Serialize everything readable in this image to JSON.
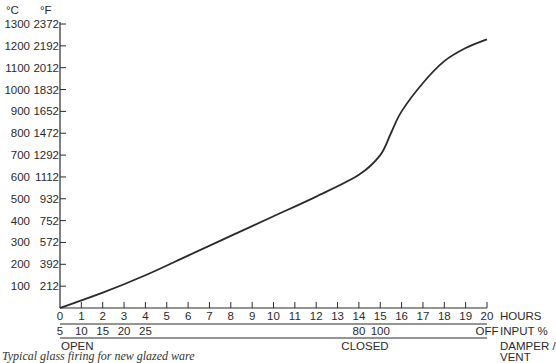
{
  "chart_data": {
    "type": "line",
    "title": "",
    "caption": "Typical glass firing for new glazed ware",
    "xlabel": "HOURS",
    "ylabel_celsius": "°C",
    "ylabel_fahrenheit": "°F",
    "y_ticks_celsius": [
      "100",
      "200",
      "300",
      "400",
      "500",
      "600",
      "700",
      "800",
      "900",
      "1000",
      "1100",
      "1200",
      "1300"
    ],
    "y_ticks_fahrenheit": [
      "212",
      "392",
      "572",
      "752",
      "932",
      "1112",
      "1292",
      "1472",
      "1652",
      "1832",
      "2012",
      "2192",
      "2372"
    ],
    "ylim": [
      0,
      1300
    ],
    "x_ticks": [
      "0",
      "1",
      "2",
      "3",
      "4",
      "5",
      "6",
      "7",
      "8",
      "9",
      "10",
      "11",
      "12",
      "13",
      "14",
      "15",
      "16",
      "17",
      "18",
      "19",
      "20"
    ],
    "xlim": [
      0,
      20
    ],
    "grid": false,
    "series": [
      {
        "name": "Firing temperature (°C)",
        "x": [
          0,
          1,
          2,
          3,
          4,
          5,
          6,
          7,
          8,
          9,
          10,
          11,
          12,
          13,
          14,
          15,
          15.5,
          16,
          17,
          18,
          19,
          20
        ],
        "values": [
          0,
          60,
          130,
          200,
          270,
          350,
          430,
          510,
          590,
          670,
          750,
          830,
          910,
          990,
          1080,
          1200,
          1380,
          1560,
          1800,
          1970,
          2060,
          2100
        ]
      }
    ],
    "values_celsius_est": {
      "x": [
        0,
        2,
        4,
        6,
        8,
        10,
        12,
        14,
        15,
        15.5,
        16,
        17,
        18,
        19,
        20
      ],
      "y": [
        0,
        70,
        150,
        240,
        330,
        420,
        510,
        610,
        700,
        800,
        900,
        1030,
        1130,
        1190,
        1230
      ]
    },
    "annotations": {
      "input_row_label": "INPUT %",
      "input_values": [
        {
          "hour": 0,
          "label": "5"
        },
        {
          "hour": 1,
          "label": "10"
        },
        {
          "hour": 2,
          "label": "15"
        },
        {
          "hour": 3,
          "label": "20"
        },
        {
          "hour": 4,
          "label": "25"
        },
        {
          "hour": 14,
          "label": "80"
        },
        {
          "hour": 15,
          "label": "100"
        },
        {
          "hour": 20,
          "label": "OFF"
        }
      ],
      "damper_row_label_line1": "DAMPER /",
      "damper_row_label_line2": "VENT",
      "damper_states": [
        {
          "hour": 0,
          "label": "OPEN"
        },
        {
          "hour": 14.5,
          "label": "CLOSED"
        }
      ]
    }
  },
  "labels": {
    "celsius_unit": "°C",
    "fahrenheit_unit": "°F",
    "hours": "HOURS",
    "input": "INPUT %",
    "damper1": "DAMPER /",
    "damper2": "VENT",
    "open": "OPEN",
    "closed": "CLOSED",
    "caption": "Typical glass firing for new glazed ware"
  },
  "colors": {
    "ink": "#2a2a2a",
    "background": "#ffffff"
  }
}
